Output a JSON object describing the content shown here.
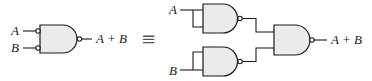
{
  "diagram": {
    "left": {
      "gate_type": "AND gate with inverted inputs and inverted output (OR equivalent)",
      "input_a": "A",
      "input_b": "B",
      "output": "A + B"
    },
    "equivalence_symbol": "≡",
    "right": {
      "gates": [
        {
          "id": "nand-top",
          "type": "NAND",
          "inputs_tied": "A"
        },
        {
          "id": "nand-bottom",
          "type": "NAND",
          "inputs_tied": "B"
        },
        {
          "id": "nand-output",
          "type": "NAND",
          "inputs": [
            "nand-top",
            "nand-bottom"
          ]
        }
      ],
      "input_a": "A",
      "input_b": "B",
      "output": "A + B"
    }
  }
}
